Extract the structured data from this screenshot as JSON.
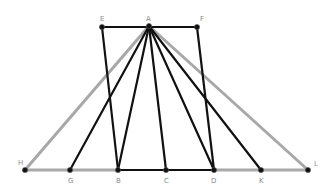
{
  "diagram": {
    "type": "geometry",
    "colors": {
      "black_line": "#111111",
      "gray_line": "#a8a8a8",
      "point": "#111111",
      "label": "#8a8a8a",
      "background": "#ffffff"
    },
    "points": [
      {
        "id": "A",
        "x": 149,
        "y": 26,
        "lx": 146,
        "ly": 21
      },
      {
        "id": "E",
        "x": 102,
        "y": 27,
        "lx": 100,
        "ly": 21
      },
      {
        "id": "F",
        "x": 197,
        "y": 27,
        "lx": 200,
        "ly": 21
      },
      {
        "id": "H",
        "x": 25,
        "y": 170,
        "lx": 18,
        "ly": 165
      },
      {
        "id": "G",
        "x": 70,
        "y": 170,
        "lx": 68,
        "ly": 183
      },
      {
        "id": "B",
        "x": 118,
        "y": 170,
        "lx": 116,
        "ly": 183
      },
      {
        "id": "C",
        "x": 166,
        "y": 170,
        "lx": 164,
        "ly": 183
      },
      {
        "id": "D",
        "x": 214,
        "y": 170,
        "lx": 211,
        "ly": 183
      },
      {
        "id": "K",
        "x": 261,
        "y": 170,
        "lx": 259,
        "ly": 183
      },
      {
        "id": "L",
        "x": 308,
        "y": 170,
        "lx": 314,
        "ly": 166
      }
    ],
    "segments": [
      {
        "from": "A",
        "to": "H",
        "style": "gray"
      },
      {
        "from": "A",
        "to": "L",
        "style": "gray"
      },
      {
        "from": "H",
        "to": "B",
        "style": "gray"
      },
      {
        "from": "D",
        "to": "L",
        "style": "gray"
      },
      {
        "from": "E",
        "to": "F",
        "style": "black"
      },
      {
        "from": "E",
        "to": "B",
        "style": "black"
      },
      {
        "from": "F",
        "to": "D",
        "style": "black"
      },
      {
        "from": "A",
        "to": "G",
        "style": "black"
      },
      {
        "from": "A",
        "to": "B",
        "style": "black"
      },
      {
        "from": "A",
        "to": "C",
        "style": "black"
      },
      {
        "from": "A",
        "to": "D",
        "style": "black"
      },
      {
        "from": "A",
        "to": "K",
        "style": "black"
      },
      {
        "from": "B",
        "to": "D",
        "style": "black"
      }
    ]
  }
}
